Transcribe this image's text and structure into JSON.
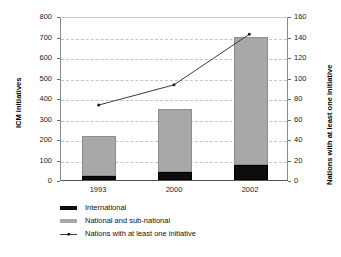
{
  "chart_data": {
    "type": "bar",
    "title": "",
    "categories": [
      "1993",
      "2000",
      "2002"
    ],
    "series": [
      {
        "name": "International",
        "axis": "left",
        "color": "#0d0d0d",
        "values": [
          18,
          38,
          72
        ]
      },
      {
        "name": "National and sub-national",
        "axis": "left",
        "color": "#a8a8a8",
        "values": [
          197,
          307,
          628
        ]
      },
      {
        "name": "Nations with at least one initiative",
        "axis": "right",
        "type": "line",
        "color": "#3a3a3a",
        "values": [
          74,
          94,
          144
        ]
      }
    ],
    "stacked_totals": [
      215,
      345,
      700
    ],
    "xlabel": "",
    "ylabel": "ICM initiatives",
    "y2label": "Nations with at least one initiative",
    "ylim": [
      0,
      800
    ],
    "y2lim": [
      0,
      160
    ],
    "yticks": [
      "0",
      "100",
      "200",
      "300",
      "400",
      "500",
      "600",
      "700",
      "800"
    ],
    "y2ticks": [
      "0",
      "20",
      "40",
      "60",
      "80",
      "100",
      "120",
      "140",
      "160"
    ],
    "grid": true,
    "grid_axis": "y",
    "legend_position": "bottom-left"
  },
  "axes": {
    "left_title": "ICM initiatives",
    "right_title": "Nations with at least one initiative",
    "left_ticks": [
      "800",
      "700",
      "600",
      "500",
      "400",
      "300",
      "200",
      "100",
      "0"
    ],
    "right_ticks": [
      "160",
      "140",
      "120",
      "100",
      "80",
      "60",
      "40",
      "20",
      "0"
    ],
    "x_ticks": [
      "1993",
      "2000",
      "2002"
    ]
  },
  "legend": {
    "items": [
      {
        "label": "International",
        "marker": "black-square-swatch"
      },
      {
        "label": "National and sub-national",
        "marker": "gray-square-swatch"
      },
      {
        "label": "Nations with at least one initiative",
        "marker": "line-with-point-marker"
      }
    ]
  },
  "colors": {
    "international": "#0d0d0d",
    "national": "#a8a8a8",
    "line": "#3a3a3a",
    "gridline": "#b9c6d6",
    "axis": "#555555",
    "text": "#111111",
    "background": "#ffffff"
  }
}
